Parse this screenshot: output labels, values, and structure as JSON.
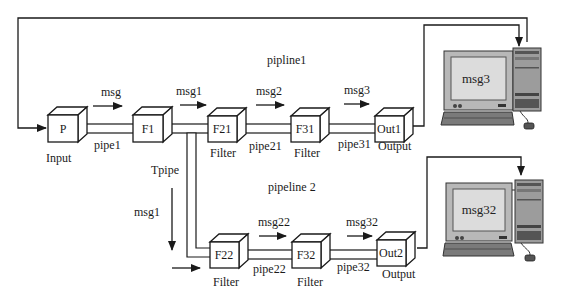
{
  "diagram": {
    "type": "pipe-and-filter architecture",
    "pipelines": [
      {
        "label": "pipline1"
      },
      {
        "label": "pipeline 2"
      }
    ],
    "nodes": {
      "P": {
        "label": "P",
        "caption": "Input"
      },
      "F1": {
        "label": "F1",
        "caption": ""
      },
      "F21": {
        "label": "F21",
        "caption": "Filter"
      },
      "F31": {
        "label": "F31",
        "caption": "Filter"
      },
      "Out1": {
        "label": "Out1",
        "caption": "Output"
      },
      "F22": {
        "label": "F22",
        "caption": "Filter"
      },
      "F32": {
        "label": "F32",
        "caption": "Filter"
      },
      "Out2": {
        "label": "Out2",
        "caption": "Output"
      }
    },
    "pipes": {
      "pipe1": "pipe1",
      "pipe21": "pipe21",
      "pipe31": "pipe31",
      "tpipe": "Tpipe",
      "pipe22": "pipe22",
      "pipe32": "pipe32"
    },
    "messages": {
      "msg": "msg",
      "msg1_top": "msg1",
      "msg2": "msg2",
      "msg3": "msg3",
      "msg1_down": "msg1",
      "msg22": "msg22",
      "msg32": "msg32"
    },
    "computers": [
      {
        "screen_text": "msg3"
      },
      {
        "screen_text": "msg32"
      }
    ]
  }
}
